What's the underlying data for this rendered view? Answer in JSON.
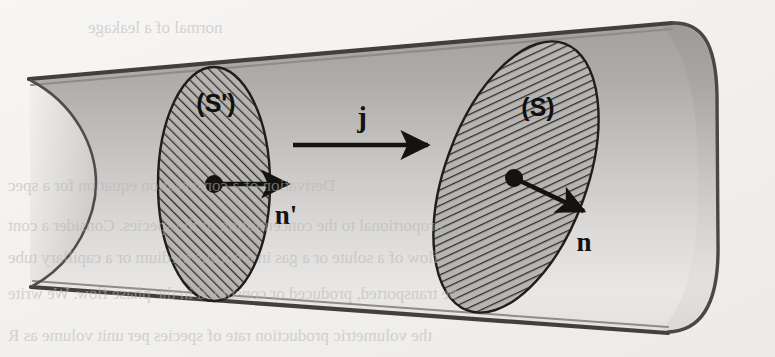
{
  "figure": {
    "background_color": "#f4f3f1",
    "paper_texture_color": "#eceae7"
  },
  "tube": {
    "name": "flux-tube",
    "body_fill_top": "#a9a7a4",
    "body_fill_bottom": "#e9e8e6",
    "outline_color": "#3b3a38",
    "cap_fill_top": "#9d9b98",
    "cap_fill_bottom": "#dedcda",
    "top_edge": {
      "x1": 28,
      "y1": 79,
      "x2": 700,
      "y2": 24
    },
    "bottom_edge": {
      "x1": 30,
      "y1": 286,
      "x2": 690,
      "y2": 332
    },
    "right_cap_center_x": 700,
    "left_open_arc_x": 30
  },
  "cross_sections": [
    {
      "id": "s-prime",
      "label": "(S')",
      "label_x": 216,
      "label_y": 104,
      "center_x": 214,
      "center_y": 184,
      "rx": 56,
      "ry": 117,
      "rotation_deg": 0,
      "fill": "#b7b5b2",
      "hatch_direction": "forward-slash",
      "hatch_color": "#2e2d2b"
    },
    {
      "id": "s",
      "label": "(S)",
      "label_x": 538,
      "label_y": 108,
      "center_x": 516,
      "center_y": 177,
      "rx": 71,
      "ry": 142,
      "rotation_deg": 20,
      "fill": "#b7b5b2",
      "hatch_direction": "back-slash",
      "hatch_color": "#2e2d2b"
    }
  ],
  "vectors": [
    {
      "id": "n-prime",
      "label": "n'",
      "label_x": 286,
      "label_y": 215,
      "from_x": 214,
      "from_y": 184,
      "to_x": 297,
      "to_y": 184,
      "dot_radius": 9,
      "color": "#141312"
    },
    {
      "id": "n",
      "label": "n",
      "from_x": 514,
      "from_y": 178,
      "to_x": 592,
      "to_y": 215,
      "label_x": 584,
      "label_y": 242,
      "dot_radius": 9,
      "color": "#141312"
    },
    {
      "id": "j",
      "label": "j",
      "from_x": 293,
      "from_y": 145,
      "to_x": 437,
      "to_y": 145,
      "dot_radius": 0,
      "label_x": 362,
      "label_y": 118,
      "color": "#141312"
    }
  ],
  "ghost_text": [
    {
      "id": "ghost-top",
      "text": "normal of a leakage",
      "x": 88,
      "y": 18,
      "size": 17
    },
    {
      "id": "ghost-mid-1",
      "text": "Derivation of a conservation equation for a spec",
      "x": 8,
      "y": 176,
      "size": 17
    },
    {
      "id": "ghost-mid-2",
      "text": "proportional to the concentration of the species. Consider a cont",
      "x": 8,
      "y": 216,
      "size": 17
    },
    {
      "id": "ghost-mid-3",
      "text": "flow of a solute or a gas in a porous medium or a capillary tube",
      "x": 8,
      "y": 248,
      "size": 17
    },
    {
      "id": "ghost-mid-4",
      "text": "be transported, produced or consumed in the phase flow. We write",
      "x": 8,
      "y": 284,
      "size": 17
    },
    {
      "id": "ghost-bottom",
      "text": "the volumetric production rate of species per unit volume as R",
      "x": 8,
      "y": 326,
      "size": 17
    }
  ]
}
